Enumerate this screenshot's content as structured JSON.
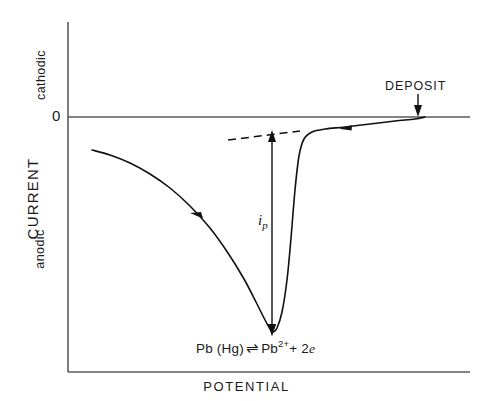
{
  "chart_data": {
    "type": "line",
    "title": "",
    "xlabel": "POTENTIAL",
    "ylabel": "CURRENT",
    "grid": false,
    "legend": null,
    "axis_direction_labels": {
      "y_positive": "cathodic",
      "y_negative": "anodic"
    },
    "y_tick_labels": [
      "0"
    ],
    "x_tick_labels": [],
    "series": [
      {
        "name": "stripping-voltammogram",
        "scan_direction": "right-to-left",
        "points": [
          [
            92,
            150
          ],
          [
            110,
            155
          ],
          [
            130,
            163
          ],
          [
            150,
            174
          ],
          [
            170,
            188
          ],
          [
            190,
            206
          ],
          [
            210,
            228
          ],
          [
            228,
            253
          ],
          [
            244,
            279
          ],
          [
            256,
            302
          ],
          [
            264,
            318
          ],
          [
            270,
            329
          ],
          [
            273,
            332
          ],
          [
            277,
            328
          ],
          [
            282,
            312
          ],
          [
            287,
            280
          ],
          [
            291,
            238
          ],
          [
            295,
            190
          ],
          [
            299,
            156
          ],
          [
            304,
            139
          ],
          [
            312,
            132
          ],
          [
            325,
            129
          ],
          [
            345,
            127
          ],
          [
            370,
            124
          ],
          [
            395,
            121
          ],
          [
            415,
            119
          ],
          [
            425,
            117
          ]
        ]
      }
    ],
    "baseline": {
      "name": "extrapolated-residual-baseline",
      "style": "dashed",
      "points": [
        [
          228,
          140
        ],
        [
          300,
          131
        ]
      ]
    },
    "annotations": [
      {
        "name": "peak-current",
        "label": "i_p",
        "label_text": "i",
        "label_sub": "p",
        "type": "double-headed-vertical-arrow",
        "x": 272,
        "y_top": 133,
        "y_bottom": 332
      },
      {
        "name": "deposit",
        "label": "DEPOSIT",
        "type": "down-arrow",
        "arrow_x": 418,
        "arrow_y_top": 94,
        "arrow_y_bottom": 115
      },
      {
        "name": "scan-direction-marker-left-branch",
        "type": "arrowhead",
        "x": 197,
        "y": 216,
        "direction": "left"
      },
      {
        "name": "scan-direction-marker-right-branch",
        "type": "arrowhead",
        "x": 347,
        "y": 128,
        "direction": "left"
      },
      {
        "name": "electrode-reaction",
        "type": "text",
        "label": "Pb(Hg) ⇌ Pb2+ + 2e"
      }
    ],
    "axes": {
      "y_axis_x": 68,
      "y_axis_top": 22,
      "zero_line_y": 117,
      "x_axis_y": 372,
      "x_axis_left": 68,
      "x_axis_right": 470
    }
  },
  "labels": {
    "y_axis_title": "CURRENT",
    "y_axis_upper_region": "cathodic",
    "y_axis_lower_region": "anodic",
    "y_axis_zero_tick": "0",
    "x_axis_title": "POTENTIAL",
    "deposit_annotation": "DEPOSIT",
    "peak_current_symbol": "i",
    "peak_current_subscript": "p"
  },
  "reaction": {
    "reactant": "Pb (Hg)",
    "equilibrium_symbol": "⇌",
    "product_species": "Pb",
    "product_charge": "2+",
    "product_tail": "+ 2",
    "electron_symbol": "e"
  },
  "colors": {
    "background": "#ffffff",
    "ink": "#1a1a1a",
    "axis": "#555555",
    "curve": "#111111"
  }
}
